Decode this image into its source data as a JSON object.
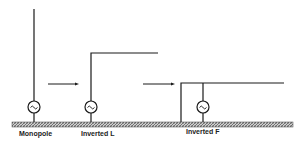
{
  "diagram": {
    "labels": {
      "monopole": "Monopole",
      "inverted_l": "Inverted L",
      "inverted_f": "Inverted F"
    },
    "colors": {
      "line": "#1a1a1a",
      "ground_fill": "#9a9a9a",
      "background": "#ffffff"
    },
    "icons": {
      "source": "ac-source-icon (circle with ~)",
      "arrow": "right-arrow-icon"
    }
  }
}
